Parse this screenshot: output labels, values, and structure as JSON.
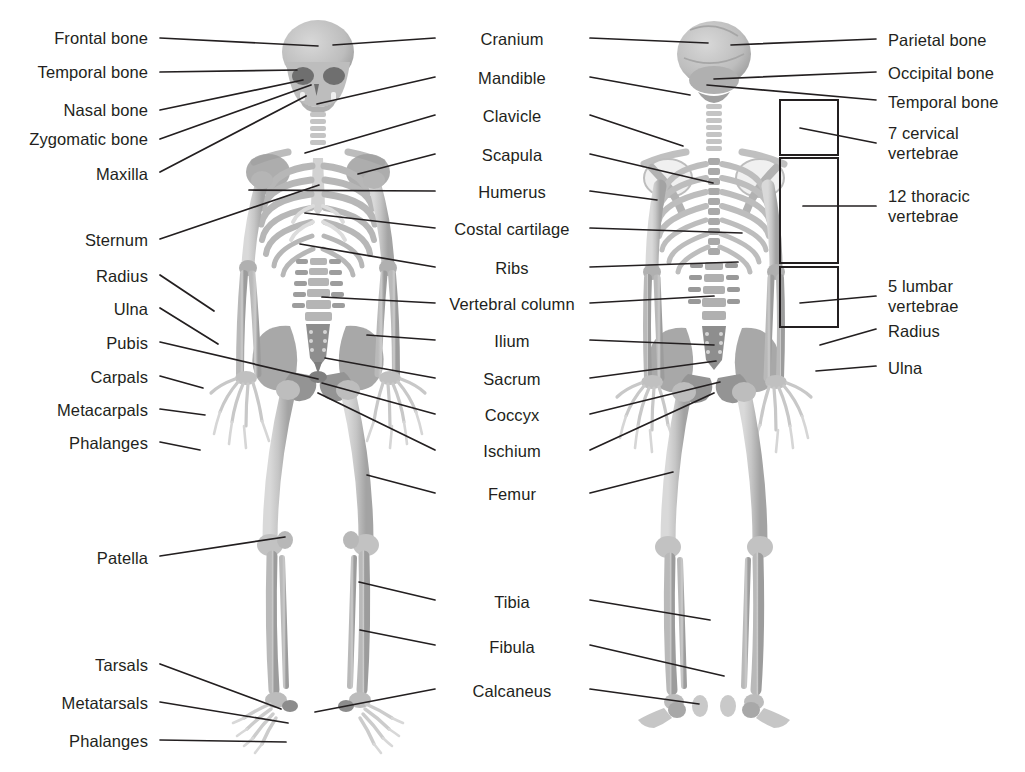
{
  "diagram": {
    "background_color": "#ffffff",
    "text_color": "#231f20",
    "leader_line_color": "#231f20",
    "bone_light_color": "#cfcfcf",
    "bone_mid_color": "#b3b3b3",
    "bone_dark_color": "#8f8f8f",
    "bone_shadow_color": "#6e6e6e"
  },
  "labels_left": [
    {
      "text": "Frontal bone",
      "x": 148,
      "y": 28,
      "lx": 160,
      "ly": 38,
      "tx": 318,
      "ty": 46
    },
    {
      "text": "Temporal bone",
      "x": 148,
      "y": 62,
      "lx": 160,
      "ly": 72,
      "tx": 297,
      "ty": 70
    },
    {
      "text": "Nasal bone",
      "x": 148,
      "y": 100,
      "lx": 160,
      "ly": 110,
      "tx": 303,
      "ty": 80
    },
    {
      "text": "Zygomatic bone",
      "x": 148,
      "y": 129,
      "lx": 160,
      "ly": 139,
      "tx": 311,
      "ty": 85
    },
    {
      "text": "Maxilla",
      "x": 148,
      "y": 164,
      "lx": 160,
      "ly": 172,
      "tx": 306,
      "ty": 96
    },
    {
      "text": "Sternum",
      "x": 148,
      "y": 230,
      "lx": 160,
      "ly": 239,
      "tx": 319,
      "ty": 185
    },
    {
      "text": "Radius",
      "x": 148,
      "y": 266,
      "lx": 160,
      "ly": 275,
      "tx": 214,
      "ty": 311
    },
    {
      "text": "Ulna",
      "x": 148,
      "y": 299,
      "lx": 160,
      "ly": 308,
      "tx": 218,
      "ty": 344
    },
    {
      "text": "Pubis",
      "x": 148,
      "y": 333,
      "lx": 160,
      "ly": 342,
      "tx": 318,
      "ty": 379
    },
    {
      "text": "Carpals",
      "x": 148,
      "y": 367,
      "lx": 160,
      "ly": 376,
      "tx": 203,
      "ty": 388
    },
    {
      "text": "Metacarpals",
      "x": 148,
      "y": 400,
      "lx": 160,
      "ly": 409,
      "tx": 205,
      "ty": 415
    },
    {
      "text": "Phalanges",
      "x": 148,
      "y": 433,
      "lx": 160,
      "ly": 442,
      "tx": 200,
      "ty": 450
    },
    {
      "text": "Patella",
      "x": 148,
      "y": 548,
      "lx": 160,
      "ly": 556,
      "tx": 285,
      "ty": 537
    },
    {
      "text": "Tarsals",
      "x": 148,
      "y": 655,
      "lx": 160,
      "ly": 664,
      "tx": 281,
      "ty": 709
    },
    {
      "text": "Metatarsals",
      "x": 148,
      "y": 693,
      "lx": 160,
      "ly": 702,
      "tx": 288,
      "ty": 723
    },
    {
      "text": "Phalanges",
      "x": 148,
      "y": 731,
      "lx": 160,
      "ly": 740,
      "tx": 286,
      "ty": 742
    }
  ],
  "labels_center": [
    {
      "text": "Cranium",
      "x": 512,
      "y": 29,
      "lw": 442,
      "rw": 582,
      "lx": 435,
      "ly": 38,
      "ltx": 333,
      "lty": 45,
      "rx": 590,
      "ry": 38,
      "rtx": 708,
      "rty": 43
    },
    {
      "text": "Mandible",
      "x": 512,
      "y": 68,
      "lw": 442,
      "rw": 582,
      "lx": 435,
      "ly": 77,
      "ltx": 317,
      "lty": 104,
      "rx": 590,
      "ry": 77,
      "rtx": 690,
      "rty": 95
    },
    {
      "text": "Clavicle",
      "x": 512,
      "y": 106,
      "lw": 442,
      "rw": 582,
      "lx": 435,
      "ly": 115,
      "ltx": 305,
      "lty": 153,
      "rx": 590,
      "ry": 115,
      "rtx": 683,
      "rty": 146
    },
    {
      "text": "Scapula",
      "x": 512,
      "y": 145,
      "lw": 442,
      "rw": 582,
      "lx": 435,
      "ly": 154,
      "ltx": 358,
      "lty": 174,
      "rx": 590,
      "ry": 154,
      "rtx": 713,
      "rty": 183
    },
    {
      "text": "Humerus",
      "x": 512,
      "y": 182,
      "lw": 442,
      "rw": 582,
      "lx": 435,
      "ly": 191,
      "ltx": 249,
      "lty": 190,
      "rx": 590,
      "ry": 191,
      "rtx": 657,
      "rty": 200
    },
    {
      "text": "Costal cartilage",
      "x": 512,
      "y": 219,
      "lw": 442,
      "rw": 582,
      "lx": 435,
      "ly": 228,
      "ltx": 305,
      "lty": 213,
      "rx": 590,
      "ry": 228,
      "rtx": 742,
      "rty": 233
    },
    {
      "text": "Ribs",
      "x": 512,
      "y": 258,
      "lw": 442,
      "rw": 582,
      "lx": 435,
      "ly": 267,
      "ltx": 300,
      "lty": 244,
      "rx": 590,
      "ry": 267,
      "rtx": 738,
      "rty": 262
    },
    {
      "text": "Vertebral column",
      "x": 512,
      "y": 294,
      "lw": 442,
      "rw": 582,
      "lx": 435,
      "ly": 303,
      "ltx": 322,
      "lty": 297,
      "rx": 590,
      "ry": 303,
      "rtx": 714,
      "rty": 296
    },
    {
      "text": "Ilium",
      "x": 512,
      "y": 331,
      "lw": 442,
      "rw": 582,
      "lx": 435,
      "ly": 340,
      "ltx": 367,
      "lty": 335,
      "rx": 590,
      "ry": 340,
      "rtx": 714,
      "rty": 345
    },
    {
      "text": "Sacrum",
      "x": 512,
      "y": 369,
      "lw": 442,
      "rw": 582,
      "lx": 435,
      "ly": 378,
      "ltx": 325,
      "lty": 358,
      "rx": 590,
      "ry": 378,
      "rtx": 716,
      "rty": 361
    },
    {
      "text": "Coccyx",
      "x": 512,
      "y": 405,
      "lw": 442,
      "rw": 582,
      "lx": 435,
      "ly": 414,
      "ltx": 322,
      "lty": 383,
      "rx": 590,
      "ry": 414,
      "rtx": 720,
      "rty": 382
    },
    {
      "text": "Ischium",
      "x": 512,
      "y": 441,
      "lw": 442,
      "rw": 582,
      "lx": 435,
      "ly": 450,
      "ltx": 318,
      "lty": 393,
      "rx": 590,
      "ry": 450,
      "rtx": 714,
      "rty": 393
    },
    {
      "text": "Femur",
      "x": 512,
      "y": 484,
      "lw": 442,
      "rw": 582,
      "lx": 435,
      "ly": 493,
      "ltx": 367,
      "lty": 475,
      "rx": 590,
      "ry": 493,
      "rtx": 673,
      "rty": 472
    },
    {
      "text": "Tibia",
      "x": 512,
      "y": 592,
      "lw": 442,
      "rw": 582,
      "lx": 435,
      "ly": 600,
      "ltx": 359,
      "lty": 582,
      "rx": 590,
      "ry": 600,
      "rtx": 710,
      "rty": 620
    },
    {
      "text": "Fibula",
      "x": 512,
      "y": 637,
      "lw": 442,
      "rw": 582,
      "lx": 435,
      "ly": 645,
      "ltx": 360,
      "lty": 630,
      "rx": 590,
      "ry": 645,
      "rtx": 724,
      "rty": 676
    },
    {
      "text": "Calcaneus",
      "x": 512,
      "y": 681,
      "lw": 442,
      "rw": 582,
      "lx": 435,
      "ly": 689,
      "ltx": 315,
      "lty": 712,
      "rx": 590,
      "ry": 689,
      "rtx": 699,
      "rty": 704
    }
  ],
  "labels_right": [
    {
      "text": "Parietal bone",
      "x": 888,
      "y": 30,
      "lx": 876,
      "ly": 39,
      "tx": 731,
      "ty": 45
    },
    {
      "text": "Occipital bone",
      "x": 888,
      "y": 63,
      "lx": 876,
      "ly": 72,
      "tx": 714,
      "ty": 79
    },
    {
      "text": "Temporal bone",
      "x": 888,
      "y": 92,
      "lx": 876,
      "ly": 100,
      "tx": 707,
      "ty": 85
    },
    {
      "text": "7 cervical",
      "x": 888,
      "y": 123,
      "line2": "vertebrae",
      "lx": 876,
      "ly": 143,
      "tx": 800,
      "ty": 128
    },
    {
      "text": "12 thoracic",
      "x": 888,
      "y": 186,
      "line2": "vertebrae",
      "lx": 876,
      "ly": 206,
      "tx": 803,
      "ty": 206
    },
    {
      "text": "5 lumbar",
      "x": 888,
      "y": 276,
      "line2": "vertebrae",
      "lx": 876,
      "ly": 296,
      "tx": 800,
      "ty": 303
    },
    {
      "text": "Radius",
      "x": 888,
      "y": 321,
      "lx": 876,
      "ly": 329,
      "tx": 820,
      "ty": 345
    },
    {
      "text": "Ulna",
      "x": 888,
      "y": 358,
      "lx": 876,
      "ly": 366,
      "tx": 816,
      "ty": 371
    }
  ],
  "brackets": [
    {
      "name": "cervical-bracket",
      "x": 780,
      "y": 100,
      "w": 58,
      "h": 55
    },
    {
      "name": "thoracic-bracket",
      "x": 780,
      "y": 158,
      "w": 58,
      "h": 105
    },
    {
      "name": "lumbar-bracket",
      "x": 780,
      "y": 267,
      "w": 58,
      "h": 60
    }
  ],
  "figures": [
    {
      "name": "anterior-skeleton",
      "center_x": 318,
      "view": "front"
    },
    {
      "name": "posterior-skeleton",
      "center_x": 714,
      "view": "back"
    }
  ]
}
